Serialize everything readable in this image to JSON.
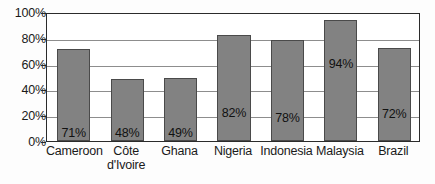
{
  "chart_data": {
    "type": "bar",
    "title": "",
    "subtitle": "",
    "xlabel": "",
    "ylabel": "",
    "categories": [
      "Cameroon",
      "Côte d'Ivoire",
      "Ghana",
      "Nigeria",
      "Indonesia",
      "Malaysia",
      "Brazil"
    ],
    "category_lines": [
      [
        "Cameroon"
      ],
      [
        "Côte",
        "d'Ivoire"
      ],
      [
        "Ghana"
      ],
      [
        "Nigeria"
      ],
      [
        "Indonesia"
      ],
      [
        "Malaysia"
      ],
      [
        "Brazil"
      ]
    ],
    "values": [
      71,
      48,
      49,
      82,
      78,
      94,
      72
    ],
    "data_labels": [
      "71%",
      "48%",
      "49%",
      "82%",
      "78%",
      "94%",
      "72%"
    ],
    "ylim": [
      0,
      100
    ],
    "ytick_values": [
      0,
      20,
      40,
      60,
      80,
      100
    ],
    "ytick_labels": [
      "0%",
      "20%",
      "40%",
      "60%",
      "80%",
      "100%"
    ],
    "grid": true,
    "legend": "none",
    "bar_color": "#828282",
    "bar_border_color": "#4a4a4a",
    "grid_color": "#8d8d8d",
    "axis_color": "#2b2b2b",
    "plot_background": "#ffffff",
    "page_background": "#fdfdfd"
  }
}
